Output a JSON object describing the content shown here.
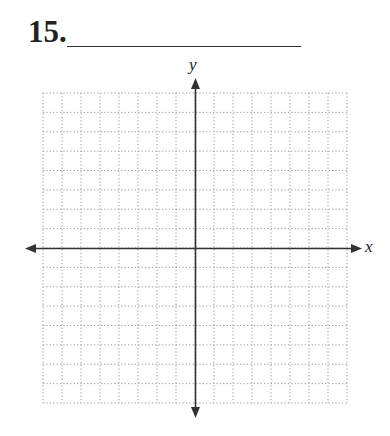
{
  "problem": {
    "number_label": "15.",
    "answer_blank": ""
  },
  "graph": {
    "x_axis_label": "x",
    "y_axis_label": "y",
    "grid": {
      "columns": 16,
      "rows": 16,
      "line_style": "dotted",
      "line_color": "#9a9a9a"
    },
    "axis_color": "#333333"
  }
}
